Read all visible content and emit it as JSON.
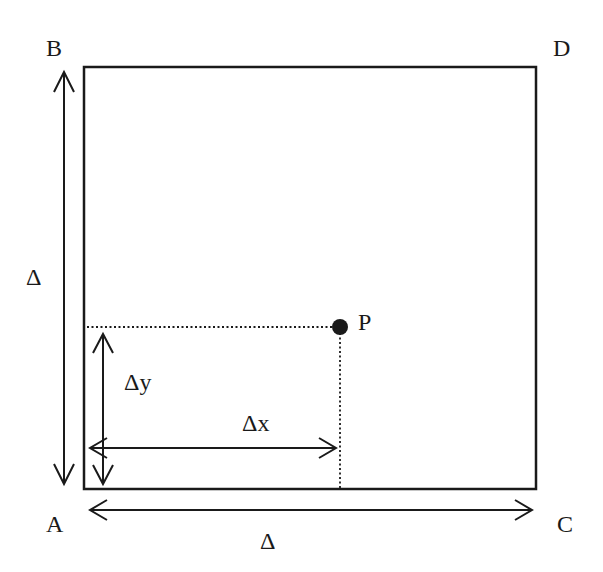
{
  "diagram": {
    "type": "geometry-square-with-point",
    "colors": {
      "stroke": "#1a1a1a",
      "background": "#ffffff"
    },
    "square": {
      "x": 84,
      "y": 67,
      "width": 452,
      "height": 422
    },
    "corners": {
      "top_left": "B",
      "top_right": "D",
      "bottom_left": "A",
      "bottom_right": "C"
    },
    "point": {
      "label": "P",
      "x": 340,
      "y": 327
    },
    "dimensions": {
      "side_vertical": "Δ",
      "side_horizontal": "Δ",
      "dx": "Δx",
      "dy": "Δy"
    }
  }
}
